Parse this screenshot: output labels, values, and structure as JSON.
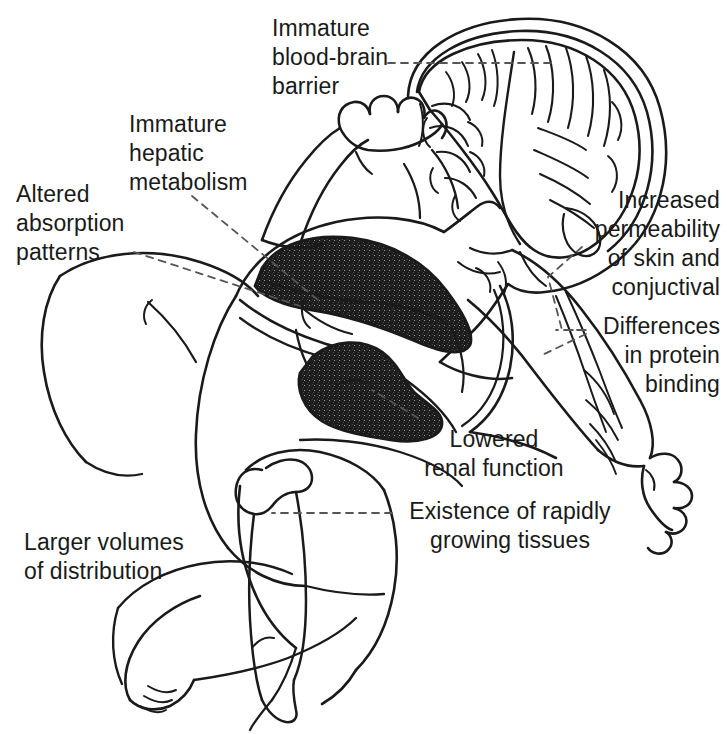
{
  "figure": {
    "type": "anatomical-line-diagram",
    "width": 727,
    "height": 734,
    "background_color": "#ffffff",
    "ink_color": "#1a1a1a",
    "organ_fill_color": "#c9c9c9",
    "leader_line_style": "dashed"
  },
  "annotations": [
    {
      "id": "blood-brain-barrier",
      "text": "Immature\nblood-brain\nbarrier",
      "align": "left",
      "x": 272,
      "y": 14,
      "width": 180,
      "target": "brain"
    },
    {
      "id": "hepatic-metabolism",
      "text": "Immature\nhepatic\nmetabolism",
      "align": "left",
      "x": 129,
      "y": 110,
      "width": 160,
      "target": "liver"
    },
    {
      "id": "absorption-patterns",
      "text": "Altered\nabsorption\npatterns",
      "align": "left",
      "x": 16,
      "y": 180,
      "width": 140,
      "target": "gastrointestinal-tract"
    },
    {
      "id": "skin-permeability",
      "text": "Increased\npermeability\nof skin and\nconjuctival",
      "align": "right",
      "x": 592,
      "y": 186,
      "width": 128,
      "target": "skin"
    },
    {
      "id": "protein-binding",
      "text": "Differences\nin protein\nbinding",
      "align": "right",
      "x": 592,
      "y": 312,
      "width": 128,
      "target": "blood-vessels"
    },
    {
      "id": "renal-function",
      "text": "Lowered\nrenal function",
      "align": "center",
      "x": 408,
      "y": 425,
      "width": 170,
      "target": "kidney"
    },
    {
      "id": "growing-tissues",
      "text": "Existence of rapidly\ngrowing tissues",
      "align": "center",
      "x": 398,
      "y": 497,
      "width": 220,
      "target": "femur-growth-plate"
    },
    {
      "id": "volumes-of-distribution",
      "text": "Larger volumes\nof distribution",
      "align": "left",
      "x": 24,
      "y": 528,
      "width": 200,
      "target": "body"
    }
  ],
  "anatomy_parts": [
    {
      "id": "brain",
      "label": "brain",
      "shaded": false
    },
    {
      "id": "skull",
      "label": "skull outline",
      "shaded": false
    },
    {
      "id": "liver",
      "label": "liver",
      "shaded": true
    },
    {
      "id": "kidney",
      "label": "kidney",
      "shaded": true
    },
    {
      "id": "stomach-intestine",
      "label": "stomach and intestine",
      "shaded": false
    },
    {
      "id": "femur",
      "label": "femur with growth plate",
      "shaded": false
    },
    {
      "id": "arm-vessels",
      "label": "arm blood vessels",
      "shaded": false
    },
    {
      "id": "torso",
      "label": "torso outline",
      "shaded": false
    },
    {
      "id": "upper-limb",
      "label": "upper limb and fist",
      "shaded": false
    },
    {
      "id": "lower-limb",
      "label": "lower limb and foot",
      "shaded": false
    }
  ]
}
